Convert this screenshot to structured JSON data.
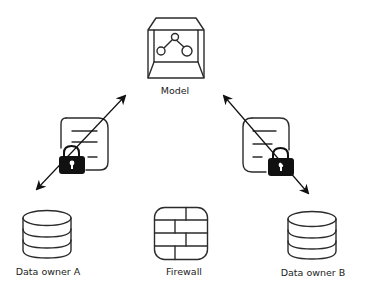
{
  "diagram": {
    "type": "federated-learning-architecture",
    "nodes": [
      {
        "id": "model",
        "label": "Model",
        "icon": "model-cube-icon"
      },
      {
        "id": "data_owner_a",
        "label": "Data owner A",
        "icon": "database-icon"
      },
      {
        "id": "firewall",
        "label": "Firewall",
        "icon": "firewall-icon"
      },
      {
        "id": "data_owner_b",
        "label": "Data owner B",
        "icon": "database-icon"
      }
    ],
    "edges": [
      {
        "from": "data_owner_a",
        "to": "model",
        "bidirectional": true,
        "via_icon": "encrypted-document-icon"
      },
      {
        "from": "data_owner_b",
        "to": "model",
        "bidirectional": true,
        "via_icon": "encrypted-document-icon"
      }
    ],
    "colors": {
      "stroke": "#2b2b2b",
      "lock_fill": "#111111",
      "text": "#222222",
      "background": "#ffffff"
    }
  }
}
